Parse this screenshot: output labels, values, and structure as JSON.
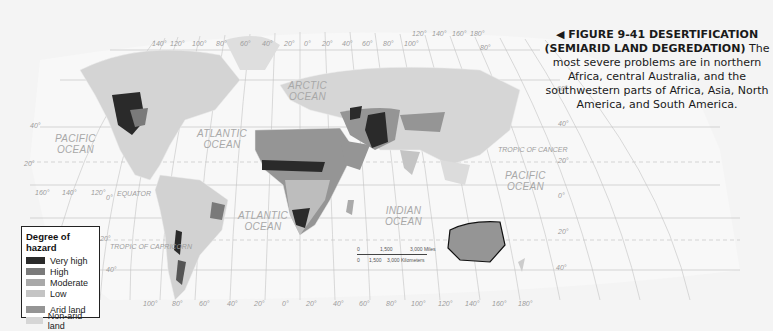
{
  "figure": {
    "arrow": "◀",
    "title_line1": "FIGURE 9-41  DESERTIFICATION",
    "title_line2": "(SEMIARID LAND DEGREDATION)",
    "body_lead": "The",
    "body_rest": "most severe problems are in northern Africa, central Australia, and the southwestern parts of Africa, Asia, North America, and South America."
  },
  "legend": {
    "title": "Degree of hazard",
    "items": [
      {
        "label": "Very high",
        "color": "#2a2a2a"
      },
      {
        "label": "High",
        "color": "#7a7a7a"
      },
      {
        "label": "Moderate",
        "color": "#a9a9a9"
      },
      {
        "label": "Low",
        "color": "#c4c4c4"
      }
    ],
    "land_items": [
      {
        "label": "Arid land",
        "color": "#959595"
      },
      {
        "label": "Non-arid land",
        "color": "#d6d6d6"
      }
    ]
  },
  "map": {
    "oceans": {
      "arctic": "ARCTIC\nOCEAN",
      "pacific_west": "PACIFIC\nOCEAN",
      "atlantic_north": "ATLANTIC\nOCEAN",
      "atlantic_south": "ATLANTIC\nOCEAN",
      "indian": "INDIAN\nOCEAN",
      "pacific_east": "PACIFIC\nOCEAN"
    },
    "lines": {
      "equator": "EQUATOR",
      "tropic_cancer": "TROPIC OF CANCER",
      "tropic_capricorn": "TROPIC OF CAPRICORN"
    },
    "top_longitudes": [
      "140°",
      "120°",
      "100°",
      "80°",
      "60°",
      "40°",
      "20°",
      "0°",
      "20°",
      "40°",
      "60°",
      "80°",
      "100°",
      "120°",
      "140°",
      "160°",
      "180°"
    ],
    "bottom_longitudes": [
      "100°",
      "80°",
      "60°",
      "40°",
      "20°",
      "0°",
      "20°",
      "40°",
      "60°",
      "80°",
      "100°",
      "120°",
      "140°",
      "160°",
      "180°"
    ],
    "left_longitudes": [
      "160°",
      "140°",
      "120°"
    ],
    "left_latitudes": [
      "40°",
      "20°",
      "0°",
      "20°",
      "40°"
    ],
    "right_latitudes": [
      "80°",
      "60°",
      "40°",
      "20°",
      "0°",
      "20°",
      "40°"
    ],
    "scale": {
      "miles": [
        "0",
        "1,500",
        "3,000 Miles"
      ],
      "km": [
        "0",
        "1,500",
        "3,000 Kilometers"
      ]
    }
  }
}
